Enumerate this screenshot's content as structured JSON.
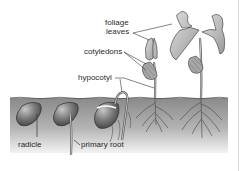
{
  "diagram": {
    "labels": {
      "foliage_leaves_line1": "foliage",
      "foliage_leaves_line2": "leaves",
      "cotyledons": "cotyledons",
      "hypocotyl": "hypocotyl",
      "radicle": "radicle",
      "primary_root": "primary root"
    },
    "stages": [
      {
        "id": "seed",
        "description": "seed with emerging radicle"
      },
      {
        "id": "primary-root",
        "description": "seed with primary root"
      },
      {
        "id": "hypocotyl-arch",
        "description": "hypocotyl arch emerging"
      },
      {
        "id": "cotyledons-seedling",
        "description": "seedling with cotyledons"
      },
      {
        "id": "foliage-plant",
        "description": "young plant with foliage leaves"
      }
    ],
    "colors": {
      "soil_top": "#8c8c8c",
      "soil_bottom": "#f2f2f2",
      "seed_dark": "#4a4a4a",
      "seed_light": "#b5b5b5",
      "leaf_fill": "#c9c9c9",
      "outline": "#333333",
      "background": "#ffffff"
    }
  }
}
